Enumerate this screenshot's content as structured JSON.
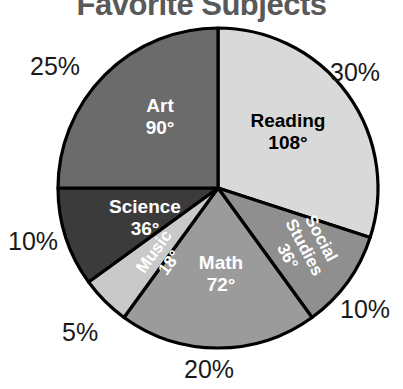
{
  "chart": {
    "title": "Favorite Subjects"
  },
  "chart_data": {
    "type": "pie",
    "title": "Favorite Subjects",
    "xlabel": "",
    "ylabel": "",
    "legend": "none",
    "grid": false,
    "center": {
      "x": 218,
      "y": 188
    },
    "radius": 160,
    "start_angle_deg": 0,
    "direction": "clockwise",
    "total_degrees": 360,
    "categories": [
      "Reading",
      "Social Studies",
      "Math",
      "Music",
      "Science",
      "Art"
    ],
    "values": [
      30,
      10,
      20,
      5,
      10,
      25
    ],
    "degrees": [
      108,
      36,
      72,
      18,
      36,
      90
    ],
    "slices": [
      {
        "name": "Reading",
        "percent": "30%",
        "degrees_label": "108°",
        "degrees": 108,
        "percent_value": 30,
        "fill": "#d9d9d9",
        "text_color": "#000000",
        "label_rotation": 0,
        "label_x": 288,
        "label_y": 133,
        "label_font_size": 19,
        "pct_x": 330,
        "pct_y": 58
      },
      {
        "name": "Social Studies",
        "percent": "10%",
        "degrees_label": "36°",
        "degrees": 36,
        "percent_value": 10,
        "fill": "#8f8f8f",
        "text_color": "#ffffff",
        "label_rotation": 62,
        "label_x": 303,
        "label_y": 248,
        "label_font_size": 17,
        "pct_x": 340,
        "pct_y": 295
      },
      {
        "name": "Math",
        "percent": "20%",
        "degrees_label": "72°",
        "degrees": 72,
        "percent_value": 20,
        "fill": "#9b9b9b",
        "text_color": "#ffffff",
        "label_rotation": 0,
        "label_x": 221,
        "label_y": 275,
        "label_font_size": 19,
        "pct_x": 184,
        "pct_y": 355
      },
      {
        "name": "Music",
        "percent": "5%",
        "degrees_label": "18°",
        "degrees": 18,
        "percent_value": 5,
        "fill": "#c9c9c9",
        "text_color": "#ffffff",
        "label_rotation": -54,
        "label_x": 163,
        "label_y": 258,
        "label_font_size": 17,
        "pct_x": 62,
        "pct_y": 318
      },
      {
        "name": "Science",
        "percent": "10%",
        "degrees_label": "36°",
        "degrees": 36,
        "percent_value": 10,
        "fill": "#3b3b3b",
        "text_color": "#ffffff",
        "label_rotation": 0,
        "label_x": 145,
        "label_y": 219,
        "label_font_size": 19,
        "pct_x": 8,
        "pct_y": 227
      },
      {
        "name": "Art",
        "percent": "25%",
        "degrees_label": "90°",
        "degrees": 90,
        "percent_value": 25,
        "fill": "#6b6b6b",
        "text_color": "#ffffff",
        "label_rotation": 0,
        "label_x": 160,
        "label_y": 118,
        "label_font_size": 19,
        "pct_x": 30,
        "pct_y": 52
      }
    ]
  }
}
